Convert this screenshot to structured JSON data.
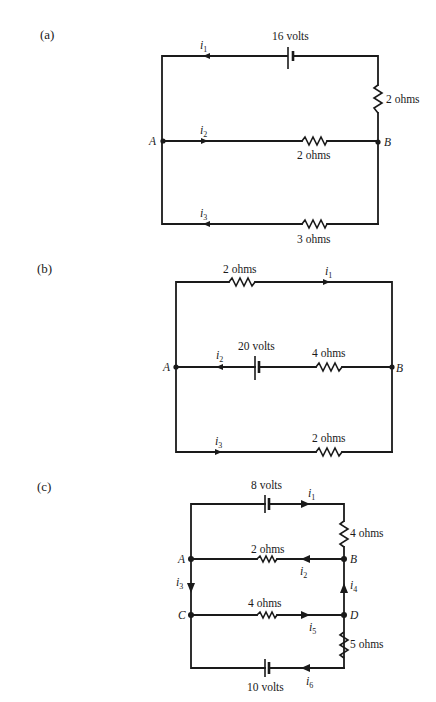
{
  "figure": {
    "circuits": [
      {
        "id": "a",
        "part_label": "(a)",
        "nodes": [
          "A",
          "B"
        ],
        "branches": [
          {
            "name": "top",
            "current": "i",
            "current_sub": "1",
            "direction": "left",
            "components": [
              {
                "type": "battery",
                "label": "16 volts"
              },
              {
                "type": "resistor",
                "label": "2 ohms",
                "position": "right-vertical"
              }
            ]
          },
          {
            "name": "middle",
            "current": "i",
            "current_sub": "2",
            "direction": "right",
            "components": [
              {
                "type": "resistor",
                "label": "2 ohms"
              }
            ]
          },
          {
            "name": "bottom",
            "current": "i",
            "current_sub": "3",
            "direction": "left",
            "components": [
              {
                "type": "resistor",
                "label": "3 ohms"
              }
            ]
          }
        ],
        "labels": {
          "battery": "16 volts",
          "r_right": "2 ohms",
          "r_mid": "2 ohms",
          "r_bottom": "3 ohms",
          "node_a": "A",
          "node_b": "B",
          "i": "i",
          "s1": "1",
          "s2": "2",
          "s3": "3"
        }
      },
      {
        "id": "b",
        "part_label": "(b)",
        "nodes": [
          "A",
          "B"
        ],
        "branches": [
          {
            "name": "top",
            "current": "i",
            "current_sub": "1",
            "direction": "right",
            "components": [
              {
                "type": "resistor",
                "label": "2 ohms"
              }
            ]
          },
          {
            "name": "middle",
            "current": "i",
            "current_sub": "2",
            "direction": "left",
            "components": [
              {
                "type": "battery",
                "label": "20 volts"
              },
              {
                "type": "resistor",
                "label": "4 ohms"
              }
            ]
          },
          {
            "name": "bottom",
            "current": "i",
            "current_sub": "3",
            "direction": "right",
            "components": [
              {
                "type": "resistor",
                "label": "2 ohms"
              }
            ]
          }
        ],
        "labels": {
          "r_top": "2 ohms",
          "battery": "20 volts",
          "r_mid": "4 ohms",
          "r_bottom": "2 ohms",
          "node_a": "A",
          "node_b": "B",
          "i": "i",
          "s1": "1",
          "s2": "2",
          "s3": "3"
        }
      },
      {
        "id": "c",
        "part_label": "(c)",
        "nodes": [
          "A",
          "B",
          "C",
          "D"
        ],
        "branches": [
          {
            "name": "top",
            "current": "i",
            "current_sub": "1",
            "direction": "right",
            "components": [
              {
                "type": "battery",
                "label": "8 volts"
              },
              {
                "type": "resistor",
                "label": "4 ohms",
                "position": "right-vertical"
              }
            ]
          },
          {
            "name": "A-B",
            "current": "i",
            "current_sub": "2",
            "direction": "left",
            "components": [
              {
                "type": "resistor",
                "label": "2 ohms"
              }
            ]
          },
          {
            "name": "A-C",
            "current": "i",
            "current_sub": "3",
            "direction": "down",
            "components": []
          },
          {
            "name": "D-B",
            "current": "i",
            "current_sub": "4",
            "direction": "up",
            "components": []
          },
          {
            "name": "C-D",
            "current": "i",
            "current_sub": "5",
            "direction": "right",
            "components": [
              {
                "type": "resistor",
                "label": "4 ohms"
              }
            ]
          },
          {
            "name": "bottom",
            "current": "i",
            "current_sub": "6",
            "direction": "left",
            "components": [
              {
                "type": "battery",
                "label": "10 volts"
              },
              {
                "type": "resistor",
                "label": "5 ohms",
                "position": "right-vertical"
              }
            ]
          }
        ],
        "labels": {
          "battery_top": "8 volts",
          "r_right_top": "4 ohms",
          "r_ab": "2 ohms",
          "r_cd": "4 ohms",
          "r_right_bottom": "5 ohms",
          "battery_bottom": "10 volts",
          "node_a": "A",
          "node_b": "B",
          "node_c": "C",
          "node_d": "D",
          "i": "i",
          "s1": "1",
          "s2": "2",
          "s3": "3",
          "s4": "4",
          "s5": "5",
          "s6": "6"
        }
      }
    ]
  }
}
